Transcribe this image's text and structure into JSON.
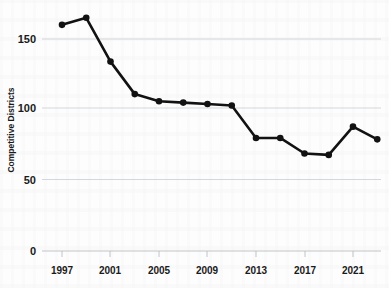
{
  "chart_data": {
    "type": "line",
    "title": "",
    "xlabel": "",
    "ylabel": "Competitive Districts",
    "x": [
      1997,
      1999,
      2001,
      2003,
      2005,
      2007,
      2009,
      2011,
      2013,
      2015,
      2017,
      2019,
      2021,
      2023
    ],
    "values": [
      160,
      165,
      134,
      111,
      106,
      105,
      104,
      103,
      80,
      80,
      69,
      68,
      88,
      79
    ],
    "series": [
      {
        "name": "Competitive Districts",
        "values": [
          160,
          165,
          134,
          111,
          106,
          105,
          104,
          103,
          80,
          80,
          69,
          68,
          88,
          79
        ]
      }
    ],
    "xlim": [
      1997,
      2023
    ],
    "ylim": [
      0,
      175
    ],
    "yticks": [
      0,
      50,
      100,
      150
    ],
    "ytick_labels": [
      "0",
      "50",
      "100",
      "150"
    ],
    "xticks": [
      1997,
      2001,
      2005,
      2009,
      2013,
      2017,
      2021
    ],
    "xtick_labels": [
      "1997",
      "2001",
      "2005",
      "2009",
      "2013",
      "2017",
      "2021"
    ],
    "grid": "horizontal",
    "legend": "none",
    "line_color": "#121212",
    "marker": "circle",
    "marker_color": "#121212",
    "gridline_color": "#c9cdd2"
  }
}
